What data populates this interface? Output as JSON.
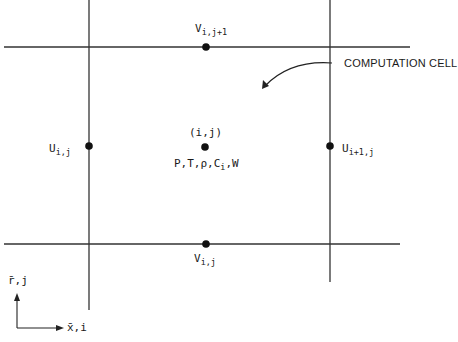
{
  "diagram": {
    "callout": "COMPUTATION CELL",
    "center_label": "(i,j)",
    "center_vars": {
      "main": "P,T,ρ,C",
      "sub": "i",
      "tail": ",W"
    },
    "v_top": {
      "main": "V",
      "sub": "i,j+1"
    },
    "v_bottom": {
      "main": "V",
      "sub": "i,j"
    },
    "u_left": {
      "main": "U",
      "sub": "i,j"
    },
    "u_right": {
      "main": "U",
      "sub": "i+1,j"
    },
    "axis_vertical": "r̄,j",
    "axis_horizontal": "x̄,i"
  },
  "colors": {
    "line": "#333333",
    "dot": "#111111",
    "background": "#ffffff"
  }
}
